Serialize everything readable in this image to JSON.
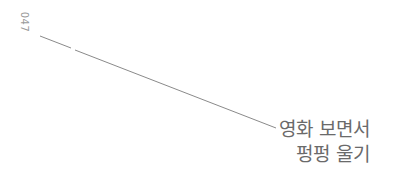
{
  "page": {
    "number": "047",
    "title_lines": [
      "영화 보면서",
      "펑펑 울기"
    ]
  },
  "colors": {
    "text": "#6a6a6a",
    "page_number": "#9a9a9a",
    "line": "#8a8a8a",
    "background": "#ffffff"
  }
}
